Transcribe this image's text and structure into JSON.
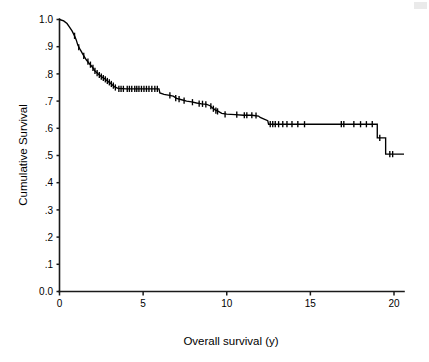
{
  "chart_data": {
    "type": "line",
    "title": "",
    "subtitle": "",
    "xlabel": "Overall survival (y)",
    "ylabel": "Cumulative Survival",
    "xlim": [
      0,
      20.8
    ],
    "ylim": [
      0.0,
      1.0
    ],
    "grid": false,
    "legend": null,
    "curve_style": "kaplan-meier step function with censoring tick marks",
    "xticks": [
      0,
      5,
      10,
      15,
      20
    ],
    "xticklabels": [
      "0",
      "5",
      "10",
      "15",
      "20"
    ],
    "yticks": [
      0.0,
      0.1,
      0.2,
      0.3,
      0.4,
      0.5,
      0.6,
      0.7,
      0.8,
      0.9,
      1.0
    ],
    "yticklabels": [
      "0.0",
      ".1",
      ".2",
      ".3",
      ".4",
      ".5",
      ".6",
      ".7",
      ".8",
      ".9",
      "1.0"
    ],
    "series": [
      {
        "name": "Cumulative survival",
        "x": [
          0.0,
          0.25,
          0.45,
          0.6,
          0.75,
          0.9,
          1.0,
          1.1,
          1.25,
          1.4,
          1.5,
          1.6,
          1.75,
          1.9,
          2.0,
          2.1,
          2.25,
          2.4,
          2.55,
          2.7,
          2.85,
          3.0,
          3.15,
          3.3,
          3.5,
          4.0,
          4.6,
          5.2,
          5.6,
          5.95,
          6.0,
          6.25,
          6.5,
          6.8,
          7.0,
          7.3,
          7.6,
          7.9,
          8.2,
          8.5,
          8.8,
          9.0,
          9.15,
          9.3,
          9.5,
          9.7,
          10.0,
          10.5,
          11.0,
          11.5,
          11.9,
          12.0,
          12.2,
          12.45,
          12.5,
          13.0,
          14.0,
          15.0,
          16.0,
          17.0,
          18.0,
          18.9,
          19.0,
          19.4,
          19.5,
          20.6
        ],
        "y": [
          1.0,
          0.995,
          0.985,
          0.972,
          0.958,
          0.94,
          0.925,
          0.905,
          0.888,
          0.872,
          0.862,
          0.852,
          0.84,
          0.83,
          0.822,
          0.812,
          0.803,
          0.795,
          0.788,
          0.782,
          0.775,
          0.768,
          0.76,
          0.752,
          0.747,
          0.745,
          0.745,
          0.745,
          0.745,
          0.745,
          0.73,
          0.725,
          0.722,
          0.718,
          0.71,
          0.705,
          0.7,
          0.697,
          0.693,
          0.69,
          0.688,
          0.683,
          0.675,
          0.668,
          0.662,
          0.655,
          0.652,
          0.65,
          0.648,
          0.648,
          0.645,
          0.64,
          0.635,
          0.628,
          0.615,
          0.615,
          0.615,
          0.615,
          0.615,
          0.615,
          0.615,
          0.615,
          0.565,
          0.565,
          0.505,
          0.505
        ],
        "censor_points": [
          {
            "x": 0.9,
            "y": 0.94
          },
          {
            "x": 1.15,
            "y": 0.898
          },
          {
            "x": 1.45,
            "y": 0.866
          },
          {
            "x": 1.7,
            "y": 0.845
          },
          {
            "x": 1.85,
            "y": 0.834
          },
          {
            "x": 2.0,
            "y": 0.822
          },
          {
            "x": 2.12,
            "y": 0.811
          },
          {
            "x": 2.25,
            "y": 0.803
          },
          {
            "x": 2.38,
            "y": 0.796
          },
          {
            "x": 2.5,
            "y": 0.79
          },
          {
            "x": 2.62,
            "y": 0.785
          },
          {
            "x": 2.74,
            "y": 0.78
          },
          {
            "x": 2.86,
            "y": 0.774
          },
          {
            "x": 2.98,
            "y": 0.769
          },
          {
            "x": 3.1,
            "y": 0.763
          },
          {
            "x": 3.22,
            "y": 0.757
          },
          {
            "x": 3.34,
            "y": 0.75
          },
          {
            "x": 3.55,
            "y": 0.745
          },
          {
            "x": 3.68,
            "y": 0.745
          },
          {
            "x": 3.82,
            "y": 0.745
          },
          {
            "x": 4.05,
            "y": 0.745
          },
          {
            "x": 4.18,
            "y": 0.745
          },
          {
            "x": 4.32,
            "y": 0.745
          },
          {
            "x": 4.5,
            "y": 0.745
          },
          {
            "x": 4.62,
            "y": 0.745
          },
          {
            "x": 4.75,
            "y": 0.745
          },
          {
            "x": 4.9,
            "y": 0.745
          },
          {
            "x": 5.05,
            "y": 0.745
          },
          {
            "x": 5.2,
            "y": 0.745
          },
          {
            "x": 5.35,
            "y": 0.745
          },
          {
            "x": 5.52,
            "y": 0.745
          },
          {
            "x": 5.7,
            "y": 0.745
          },
          {
            "x": 5.85,
            "y": 0.745
          },
          {
            "x": 6.6,
            "y": 0.721
          },
          {
            "x": 6.95,
            "y": 0.711
          },
          {
            "x": 7.15,
            "y": 0.707
          },
          {
            "x": 7.45,
            "y": 0.702
          },
          {
            "x": 7.95,
            "y": 0.696
          },
          {
            "x": 8.35,
            "y": 0.691
          },
          {
            "x": 8.55,
            "y": 0.69
          },
          {
            "x": 8.75,
            "y": 0.688
          },
          {
            "x": 9.05,
            "y": 0.681
          },
          {
            "x": 9.2,
            "y": 0.672
          },
          {
            "x": 9.35,
            "y": 0.665
          },
          {
            "x": 9.45,
            "y": 0.662
          },
          {
            "x": 9.9,
            "y": 0.651
          },
          {
            "x": 10.6,
            "y": 0.65
          },
          {
            "x": 11.05,
            "y": 0.648
          },
          {
            "x": 11.2,
            "y": 0.648
          },
          {
            "x": 11.5,
            "y": 0.648
          },
          {
            "x": 11.75,
            "y": 0.647
          },
          {
            "x": 12.6,
            "y": 0.615
          },
          {
            "x": 12.75,
            "y": 0.615
          },
          {
            "x": 12.9,
            "y": 0.615
          },
          {
            "x": 13.1,
            "y": 0.615
          },
          {
            "x": 13.35,
            "y": 0.615
          },
          {
            "x": 13.6,
            "y": 0.615
          },
          {
            "x": 13.9,
            "y": 0.615
          },
          {
            "x": 14.25,
            "y": 0.615
          },
          {
            "x": 14.65,
            "y": 0.615
          },
          {
            "x": 16.85,
            "y": 0.615
          },
          {
            "x": 17.0,
            "y": 0.615
          },
          {
            "x": 17.6,
            "y": 0.615
          },
          {
            "x": 18.0,
            "y": 0.615
          },
          {
            "x": 18.35,
            "y": 0.615
          },
          {
            "x": 18.7,
            "y": 0.615
          },
          {
            "x": 19.15,
            "y": 0.565
          },
          {
            "x": 19.75,
            "y": 0.505
          },
          {
            "x": 19.92,
            "y": 0.505
          }
        ]
      }
    ],
    "annotations": [],
    "colors": {
      "curve": "#000000",
      "axis": "#1a1a1a",
      "background": "#ffffff",
      "text": "#000000"
    },
    "key_readings": {
      "survival_at_1y": 0.925,
      "survival_at_2y": 0.822,
      "survival_at_5y": 0.745,
      "survival_at_10y": 0.652,
      "survival_at_15y": 0.615,
      "survival_at_20y": 0.505,
      "plateau_value_3_to_6y": 0.745,
      "plateau_value_12_to_19y": 0.615,
      "final_value": 0.505
    }
  }
}
